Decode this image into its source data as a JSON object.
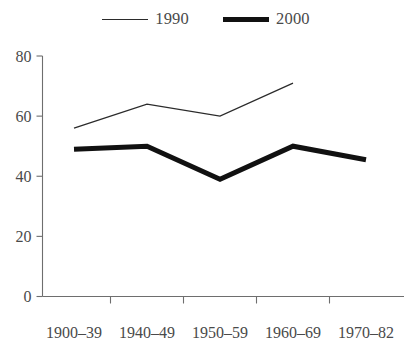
{
  "chart_data": {
    "type": "line",
    "title": "",
    "subtitle": "",
    "xlabel": "",
    "ylabel": "",
    "categories": [
      "1900–39",
      "1940–49",
      "1950–59",
      "1960–69",
      "1970–82"
    ],
    "series": [
      {
        "name": "1990",
        "values": [
          56,
          64,
          60,
          71,
          null
        ],
        "style": "thin-line",
        "color": "#2b2b2b"
      },
      {
        "name": "2000",
        "values": [
          49,
          50,
          39,
          50,
          45.5
        ],
        "style": "thick-line",
        "color": "#111111"
      }
    ],
    "ylim": [
      0,
      80
    ],
    "yticks": [
      0,
      20,
      40,
      60,
      80
    ],
    "ytick_labels": [
      "0",
      "20",
      "40",
      "60",
      "80"
    ],
    "grid": false,
    "legend_position": "top-center"
  },
  "legend": {
    "entries": [
      {
        "label": "1990",
        "swatch": "thin-line-swatch"
      },
      {
        "label": "2000",
        "swatch": "thick-line-swatch"
      }
    ]
  },
  "axes": {
    "y_labels": [
      "80",
      "60",
      "40",
      "20",
      "0"
    ],
    "x_labels": [
      "1900–39",
      "1940–49",
      "1950–59",
      "1960–69",
      "1970–82"
    ]
  },
  "colors": {
    "series_1990": "#2b2b2b",
    "series_2000": "#111111",
    "axis": "#6e6e6e",
    "text": "#4a4a4a",
    "background": "#ffffff"
  }
}
